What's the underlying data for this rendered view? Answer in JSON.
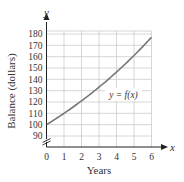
{
  "chart_data": {
    "type": "line",
    "title": "",
    "xlabel": "Years",
    "ylabel": "Balance (dollars)",
    "x_axis_var": "x",
    "y_axis_var": "y",
    "curve_label": "y = f(x)",
    "xlim": [
      0,
      6
    ],
    "ylim": [
      90,
      180
    ],
    "y_axis_break": true,
    "grid": true,
    "x_ticks": [
      "0",
      "1",
      "2",
      "3",
      "4",
      "5",
      "6"
    ],
    "y_ticks": [
      "90",
      "100",
      "110",
      "120",
      "130",
      "140",
      "150",
      "160",
      "170",
      "180"
    ],
    "series": [
      {
        "name": "y = f(x)",
        "x": [
          0,
          1,
          2,
          3,
          4,
          5,
          6
        ],
        "values": [
          100,
          110,
          121,
          133.1,
          146.4,
          161.1,
          177.2
        ]
      }
    ],
    "colors": {
      "curve": "#777777",
      "grid": "#cccccc",
      "axis": "#222222"
    }
  }
}
